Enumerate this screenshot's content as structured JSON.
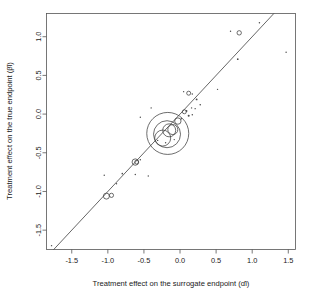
{
  "chart_data": {
    "type": "scatter",
    "title": "",
    "xlabel": "Treatment effect on the surrogate endpoint (α̂i)",
    "ylabel": "Treatment effect on the true endpoint (β̂i)",
    "xlim": [
      -1.85,
      1.6
    ],
    "ylim": [
      -1.75,
      1.3
    ],
    "xticks": [
      "-1.5",
      "-1.0",
      "-0.5",
      "0.0",
      "0.5",
      "1.0",
      "1.5"
    ],
    "xtickvalues": [
      -1.5,
      -1.0,
      -0.5,
      0.0,
      0.5,
      1.0,
      1.5
    ],
    "yticks": [
      "-1.5",
      "-1.0",
      "-0.5",
      "0.0",
      "0.5",
      "1.0"
    ],
    "ytickvalues": [
      -1.5,
      -1.0,
      -0.5,
      0.0,
      0.5,
      1.0
    ],
    "grid": false,
    "legend": "none",
    "reference_line": {
      "type": "identity",
      "slope": 1,
      "intercept": 0,
      "label": "45 degree line"
    },
    "marker_encoding": "circle radius proportional to trial size",
    "points": [
      {
        "x": -1.78,
        "y": -1.7,
        "r": 0.7
      },
      {
        "x": -1.02,
        "y": -1.06,
        "r": 3.0
      },
      {
        "x": -0.95,
        "y": -1.05,
        "r": 2.1
      },
      {
        "x": -0.88,
        "y": -0.9,
        "r": 1.0
      },
      {
        "x": -1.05,
        "y": -0.79,
        "r": 0.9
      },
      {
        "x": -0.8,
        "y": -0.77,
        "r": 1.3
      },
      {
        "x": -0.62,
        "y": -0.62,
        "r": 3.2
      },
      {
        "x": -0.6,
        "y": -0.62,
        "r": 2.0
      },
      {
        "x": -0.55,
        "y": -0.59,
        "r": 1.2
      },
      {
        "x": -0.62,
        "y": -0.78,
        "r": 1.0
      },
      {
        "x": -0.44,
        "y": -0.8,
        "r": 1.1
      },
      {
        "x": -0.31,
        "y": -0.34,
        "r": 1.0
      },
      {
        "x": -0.24,
        "y": -0.31,
        "r": 8.0
      },
      {
        "x": -0.18,
        "y": -0.26,
        "r": 13.5
      },
      {
        "x": -0.15,
        "y": -0.21,
        "r": 6.5
      },
      {
        "x": -0.17,
        "y": -0.25,
        "r": 21.0
      },
      {
        "x": -0.1,
        "y": -0.2,
        "r": 5.0
      },
      {
        "x": -0.08,
        "y": -0.33,
        "r": 1.0
      },
      {
        "x": -0.2,
        "y": -0.37,
        "r": 1.0
      },
      {
        "x": -0.03,
        "y": -0.09,
        "r": 3.2
      },
      {
        "x": 0.02,
        "y": -0.06,
        "r": 1.0
      },
      {
        "x": 0.06,
        "y": 0.03,
        "r": 2.0
      },
      {
        "x": 0.09,
        "y": 0.04,
        "r": 1.5
      },
      {
        "x": 0.12,
        "y": -0.02,
        "r": 1.6
      },
      {
        "x": 0.17,
        "y": -0.01,
        "r": 1.2
      },
      {
        "x": 0.16,
        "y": 0.08,
        "r": 1.0
      },
      {
        "x": 0.21,
        "y": 0.07,
        "r": 1.0
      },
      {
        "x": 0.23,
        "y": 0.19,
        "r": 1.5
      },
      {
        "x": 0.28,
        "y": 0.12,
        "r": 1.3
      },
      {
        "x": 0.05,
        "y": 0.29,
        "r": 1.0
      },
      {
        "x": 0.12,
        "y": 0.27,
        "r": 2.0
      },
      {
        "x": 0.17,
        "y": 0.26,
        "r": 1.0
      },
      {
        "x": -0.4,
        "y": 0.08,
        "r": 0.8
      },
      {
        "x": -0.55,
        "y": -0.04,
        "r": 0.7
      },
      {
        "x": 0.52,
        "y": 0.32,
        "r": 1.0
      },
      {
        "x": 0.7,
        "y": 1.07,
        "r": 0.8
      },
      {
        "x": 0.82,
        "y": 1.05,
        "r": 2.2
      },
      {
        "x": 0.8,
        "y": 0.71,
        "r": 1.4
      },
      {
        "x": 1.1,
        "y": 1.18,
        "r": 1.2
      },
      {
        "x": 1.47,
        "y": 0.8,
        "r": 0.9
      }
    ]
  },
  "axes": {
    "x_title": "Treatment effect on the surrogate endpoint (α̂i)",
    "y_title": "Treatment effect on the true endpoint (β̂i)"
  }
}
